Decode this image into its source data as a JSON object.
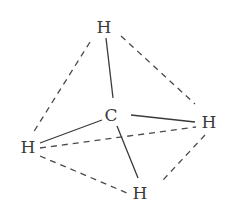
{
  "diagram": {
    "colors": {
      "background": "#ffffff",
      "line": "#3a3a3a",
      "text": "#3a3a3a"
    },
    "atoms": {
      "center": {
        "label": "C",
        "x": 111,
        "y": 121
      },
      "top": {
        "label": "H",
        "x": 104,
        "y": 33
      },
      "right": {
        "label": "H",
        "x": 209,
        "y": 128
      },
      "left": {
        "label": "H",
        "x": 28,
        "y": 153
      },
      "bottom": {
        "label": "H",
        "x": 140,
        "y": 199
      }
    },
    "bonds_solid": [
      {
        "name": "c-h-top",
        "x1": 113,
        "y1": 98,
        "x2": 106,
        "y2": 38
      },
      {
        "name": "c-h-right",
        "x1": 131,
        "y1": 115,
        "x2": 195,
        "y2": 122
      },
      {
        "name": "c-h-left",
        "x1": 102,
        "y1": 120,
        "x2": 40,
        "y2": 143
      },
      {
        "name": "c-h-bottom",
        "x1": 117,
        "y1": 126,
        "x2": 138,
        "y2": 178
      }
    ],
    "edges_dashed": [
      {
        "name": "top-left",
        "x1": 90,
        "y1": 42,
        "x2": 33,
        "y2": 133
      },
      {
        "name": "top-right",
        "x1": 121,
        "y1": 36,
        "x2": 195,
        "y2": 104
      },
      {
        "name": "left-right",
        "x1": 40,
        "y1": 148,
        "x2": 196,
        "y2": 127
      },
      {
        "name": "left-bottom",
        "x1": 40,
        "y1": 156,
        "x2": 127,
        "y2": 193
      },
      {
        "name": "right-bottom",
        "x1": 205,
        "y1": 135,
        "x2": 163,
        "y2": 180
      }
    ]
  }
}
